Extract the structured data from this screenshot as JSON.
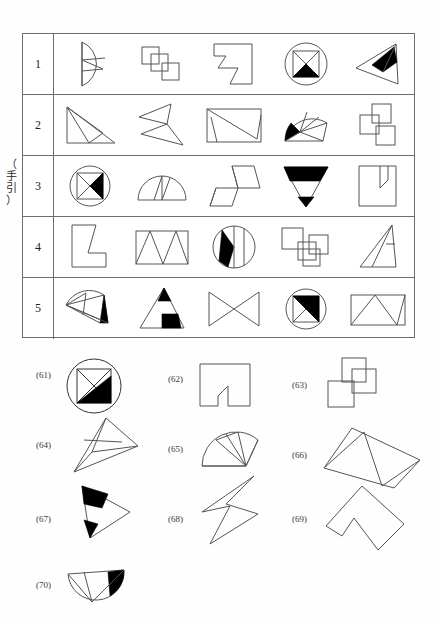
{
  "page": {
    "guide_label_chars": [
      "（",
      "手",
      "引",
      "）"
    ],
    "guide_label_text": "（手引）"
  },
  "guide_table": {
    "row_numbers": [
      "1",
      "2",
      "3",
      "4",
      "5"
    ],
    "rows": [
      {
        "number": "1",
        "figures": [
          "half-disc-divided-left",
          "three-overlapping-squares",
          "zigzag-hexagon-block",
          "circle-with-square-x-black-bottom",
          "triangle-with-black-quadrilateral"
        ]
      },
      {
        "number": "2",
        "figures": [
          "right-triangle-subdivided",
          "arrow-like-double-triangle",
          "rectangle-with-inner-zigzag",
          "fan-with-black-wedge",
          "three-overlapping-squares-offset"
        ]
      },
      {
        "number": "3",
        "figures": [
          "circle-with-square-black-left-triangle",
          "half-disc-three-sectors",
          "stepped-parallelogram-group",
          "inverted-triangle-black-bands",
          "notched-square-arrow"
        ]
      },
      {
        "number": "4",
        "figures": [
          "L-shaped-polygon",
          "rectangle-with-zigzag-triangles",
          "circle-with-black-wedge-vertical",
          "three-squares-stair",
          "triangle-with-inner-lines"
        ]
      },
      {
        "number": "5",
        "figures": [
          "fan-with-black-tip",
          "triangle-with-black-parts",
          "bowtie-double-triangle",
          "circle-with-square-black-upper",
          "rectangle-with-inner-triangles"
        ]
      }
    ]
  },
  "questions": [
    {
      "label": "(61)",
      "figure": "circle-square-diagonal-black-lower-right"
    },
    {
      "label": "(62)",
      "figure": "notched-square-arrow-outline"
    },
    {
      "label": "(63)",
      "figure": "three-overlapping-squares-diagonal"
    },
    {
      "label": "(64)",
      "figure": "elongated-triangle-subdivided"
    },
    {
      "label": "(65)",
      "figure": "fan-three-sectors"
    },
    {
      "label": "(66)",
      "figure": "tilted-rectangle-with-triangles"
    },
    {
      "label": "(67)",
      "figure": "triangle-with-two-black-wedges"
    },
    {
      "label": "(68)",
      "figure": "zigzag-lightning-outline"
    },
    {
      "label": "(69)",
      "figure": "tilted-notched-polygon"
    },
    {
      "label": "(70)",
      "figure": "half-disc-with-black-wedge"
    }
  ]
}
